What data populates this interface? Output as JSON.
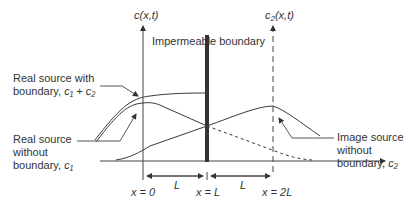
{
  "diagram": {
    "title_boundary": "Impermeable boundary",
    "axis_left_label": {
      "base": "c(x,t)"
    },
    "axis_right_label": {
      "base": "c",
      "sub": "2",
      "tail": "(x,t)"
    },
    "annotations": [
      {
        "id": "real-with-boundary",
        "line1": "Real source with",
        "line2_prefix": "boundary, ",
        "expr": "c₁ + c₂"
      },
      {
        "id": "real-without-boundary",
        "line1": "Real source",
        "line2": "without",
        "line3_prefix": "boundary, ",
        "expr": "c₁"
      },
      {
        "id": "image-without-boundary",
        "line1": "Image source",
        "line2": "without",
        "line3_prefix": "boundary, ",
        "expr": "c₂"
      }
    ],
    "x_ticks": [
      "x = 0",
      "x = L",
      "x = 2L"
    ],
    "interval_labels": [
      "L",
      "L"
    ],
    "colors": {
      "line": "#3a3a3a",
      "boundary": "#333333",
      "background": "#ffffff"
    }
  }
}
